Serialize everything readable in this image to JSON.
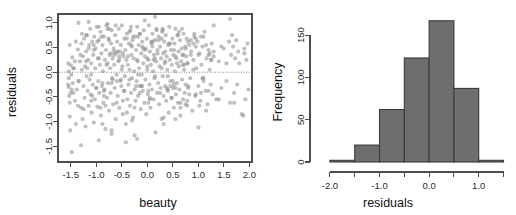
{
  "figure": {
    "width": 516,
    "height": 215,
    "background": "#ffffff",
    "point_color": "#8c8c8c",
    "bar_color": "#6e6e6e",
    "bar_border_color": "#3a3a3a",
    "axis_color": "#4d4d4d"
  },
  "chart_data": [
    {
      "type": "scatter",
      "title": "",
      "xlabel": "beauty",
      "ylabel": "residuals",
      "xlim": [
        -1.75,
        2.05
      ],
      "ylim": [
        -1.82,
        1.18
      ],
      "xticks": [
        -1.5,
        -1.0,
        -0.5,
        0.0,
        0.5,
        1.0,
        1.5,
        2.0
      ],
      "xticklabels": [
        "-1.5",
        "-1.0",
        "-0.5",
        "0.0",
        "0.5",
        "1.0",
        "1.5",
        "2.0"
      ],
      "yticks": [
        -1.5,
        -1.0,
        -0.5,
        0.0,
        0.5,
        1.0
      ],
      "yticklabels": [
        "-1.5",
        "-1.0",
        "-0.5",
        "0.0",
        "0.5",
        "1.0"
      ],
      "grid": false,
      "legend": false,
      "frame": "box",
      "annotations": [
        {
          "kind": "hline",
          "y": 0.0,
          "style": "dotted",
          "color": "#808080"
        }
      ],
      "x": [
        -1.54,
        -1.54,
        -1.54,
        -1.53,
        -1.52,
        -1.52,
        -1.51,
        -1.5,
        -1.49,
        -1.48,
        -1.47,
        -1.46,
        -1.45,
        -1.44,
        -1.42,
        -1.4,
        -1.38,
        -1.36,
        -1.34,
        -1.32,
        -1.3,
        -1.29,
        -1.28,
        -1.27,
        -1.26,
        -1.25,
        -1.24,
        -1.23,
        -1.22,
        -1.21,
        -1.2,
        -1.19,
        -1.18,
        -1.17,
        -1.16,
        -1.15,
        -1.14,
        -1.13,
        -1.12,
        -1.11,
        -1.1,
        -1.09,
        -1.08,
        -1.07,
        -1.06,
        -1.05,
        -1.04,
        -1.03,
        -1.02,
        -1.01,
        -1.0,
        -0.99,
        -0.98,
        -0.97,
        -0.96,
        -0.95,
        -0.94,
        -0.93,
        -0.92,
        -0.91,
        -0.9,
        -0.89,
        -0.88,
        -0.87,
        -0.86,
        -0.85,
        -0.84,
        -0.83,
        -0.82,
        -0.81,
        -0.8,
        -0.79,
        -0.78,
        -0.77,
        -0.76,
        -0.75,
        -0.74,
        -0.73,
        -0.72,
        -0.71,
        -0.7,
        -0.7,
        -0.69,
        -0.68,
        -0.67,
        -0.66,
        -0.65,
        -0.64,
        -0.63,
        -0.62,
        -0.61,
        -0.6,
        -0.59,
        -0.58,
        -0.57,
        -0.56,
        -0.55,
        -0.54,
        -0.53,
        -0.52,
        -0.51,
        -0.5,
        -0.49,
        -0.48,
        -0.47,
        -0.46,
        -0.45,
        -0.44,
        -0.43,
        -0.42,
        -0.41,
        -0.4,
        -0.39,
        -0.38,
        -0.37,
        -0.36,
        -0.35,
        -0.34,
        -0.33,
        -0.32,
        -0.31,
        -0.3,
        -0.29,
        -0.28,
        -0.27,
        -0.26,
        -0.25,
        -0.24,
        -0.23,
        -0.22,
        -0.21,
        -0.2,
        -0.2,
        -0.19,
        -0.18,
        -0.17,
        -0.16,
        -0.15,
        -0.14,
        -0.13,
        -0.12,
        -0.11,
        -0.1,
        -0.09,
        -0.08,
        -0.07,
        -0.06,
        -0.05,
        -0.04,
        -0.03,
        -0.02,
        -0.01,
        0.0,
        0.01,
        0.02,
        0.03,
        0.04,
        0.05,
        0.06,
        0.07,
        0.08,
        0.09,
        0.1,
        0.11,
        0.12,
        0.13,
        0.14,
        0.15,
        0.16,
        0.17,
        0.18,
        0.19,
        0.2,
        0.21,
        0.22,
        0.23,
        0.24,
        0.25,
        0.26,
        0.27,
        0.28,
        0.29,
        0.3,
        0.31,
        0.32,
        0.33,
        0.34,
        0.35,
        0.36,
        0.37,
        0.38,
        0.39,
        0.4,
        0.41,
        0.42,
        0.43,
        0.44,
        0.45,
        0.46,
        0.47,
        0.48,
        0.49,
        0.5,
        0.51,
        0.52,
        0.53,
        0.54,
        0.55,
        0.56,
        0.57,
        0.58,
        0.59,
        0.6,
        0.61,
        0.62,
        0.63,
        0.64,
        0.65,
        0.66,
        0.67,
        0.68,
        0.69,
        0.7,
        0.71,
        0.72,
        0.73,
        0.74,
        0.75,
        0.76,
        0.77,
        0.78,
        0.79,
        0.8,
        0.82,
        0.84,
        0.86,
        0.88,
        0.9,
        0.92,
        0.94,
        0.96,
        0.98,
        1.0,
        1.02,
        1.04,
        1.06,
        1.08,
        1.1,
        1.12,
        1.14,
        1.16,
        1.18,
        1.2,
        1.22,
        1.24,
        1.26,
        1.28,
        1.3,
        1.35,
        1.4,
        1.45,
        1.5,
        1.55,
        1.6,
        1.62,
        1.64,
        1.66,
        1.68,
        1.7,
        1.72,
        1.74,
        1.76,
        1.78,
        1.8,
        1.85,
        1.9,
        1.92,
        1.94,
        1.96,
        1.98,
        -1.55,
        -1.55,
        -1.5,
        -1.45,
        -1.4,
        -1.35,
        -1.31,
        -1.25,
        -1.2,
        -1.15,
        -1.1,
        -1.05,
        -1.0,
        -0.95,
        -0.9,
        -0.85,
        -0.8,
        -0.75,
        -0.7,
        -0.65,
        -0.6,
        -0.55,
        -0.5,
        -0.45,
        -0.4,
        -0.35,
        -0.3,
        -0.25,
        -0.2,
        -0.15,
        -0.1,
        -0.05,
        0.0,
        0.05,
        0.1,
        0.15,
        0.2,
        0.25,
        0.3,
        0.35,
        0.4,
        0.45,
        0.5,
        0.55,
        0.6,
        0.65,
        0.7,
        0.75,
        0.8,
        0.85,
        0.9,
        0.95,
        1.0,
        1.05,
        1.1,
        1.15,
        1.2,
        1.25,
        1.3,
        1.4,
        -1.2,
        -1.1,
        -0.95,
        -0.85,
        -0.75,
        -0.6,
        -0.48,
        -0.35,
        -0.22,
        -0.1,
        0.02,
        0.15,
        0.28,
        0.4,
        0.52,
        0.65,
        0.78,
        0.9,
        1.05,
        1.2,
        -0.88,
        -0.62,
        -0.4,
        -0.18,
        0.05,
        0.3,
        0.55,
        0.8,
        1.02,
        1.25,
        -1.3,
        -0.7,
        -0.3,
        0.1,
        0.45,
        0.85,
        1.15,
        1.55,
        1.7,
        1.9,
        -1.52,
        -1.48,
        -1.42,
        -1.36,
        -1.28,
        -1.18,
        -1.08,
        -0.98,
        -0.88,
        -0.78,
        -0.68,
        -0.58,
        -0.48,
        -0.38,
        -0.28,
        -0.18,
        -0.08,
        0.02,
        0.12,
        0.22,
        0.32,
        0.42,
        0.52,
        0.62,
        0.72,
        0.82,
        0.95,
        1.08,
        1.22,
        1.45,
        -1.05,
        -0.82,
        -0.55,
        -0.32,
        -0.12,
        0.08,
        0.28,
        0.48,
        0.7,
        0.92,
        -0.92,
        -0.72,
        -0.52,
        -0.32,
        -0.15,
        0.0,
        0.18,
        0.38,
        0.58,
        0.78,
        -1.15,
        -0.78,
        -0.42,
        -0.05,
        0.32,
        0.68,
        1.0,
        1.3,
        1.62,
        1.88,
        -0.65,
        -0.25,
        0.15,
        0.55,
        0.95,
        -1.35,
        -0.95,
        0.35,
        0.75,
        1.1
      ],
      "y": [
        0.02,
        -0.12,
        -0.3,
        -0.48,
        -0.62,
        -0.9,
        -1.18,
        0.14,
        -0.05,
        -1.62,
        0.3,
        -0.22,
        -0.42,
        0.08,
        -0.58,
        -1.05,
        -0.35,
        0.46,
        -0.18,
        0.22,
        -0.72,
        0.58,
        0.05,
        -0.95,
        0.32,
        -0.28,
        0.68,
        -0.52,
        0.12,
        -1.1,
        0.42,
        -0.08,
        0.75,
        -0.38,
        0.25,
        -0.68,
        0.55,
        -0.15,
        0.88,
        -0.45,
        0.18,
        -0.82,
        0.62,
        -0.25,
        0.35,
        -1.02,
        0.72,
        -0.55,
        0.08,
        0.48,
        -0.32,
        0.92,
        -0.7,
        0.28,
        -0.18,
        0.65,
        -0.42,
        0.15,
        0.82,
        -0.88,
        0.38,
        -0.28,
        0.55,
        0.02,
        -0.62,
        0.72,
        -0.35,
        0.25,
        -1.15,
        0.45,
        0.95,
        -0.52,
        0.18,
        -0.22,
        0.68,
        -0.78,
        0.35,
        0.08,
        -0.42,
        0.58,
        -1.25,
        0.85,
        -0.12,
        0.28,
        -0.65,
        0.48,
        0.15,
        -0.32,
        0.75,
        -0.95,
        0.38,
        -0.05,
        0.62,
        -0.48,
        0.22,
        0.88,
        -0.72,
        0.42,
        -0.18,
        0.55,
        -0.28,
        0.95,
        0.12,
        -0.85,
        0.32,
        -0.38,
        0.68,
        -0.08,
        0.45,
        -1.05,
        0.25,
        0.78,
        -0.55,
        0.15,
        -0.25,
        0.58,
        0.05,
        -0.68,
        0.85,
        -0.42,
        0.35,
        -0.12,
        0.65,
        -0.92,
        0.28,
        0.02,
        -0.35,
        0.72,
        -0.58,
        0.45,
        -0.18,
        0.92,
        -1.35,
        0.22,
        -0.48,
        0.55,
        0.08,
        -0.28,
        0.78,
        -0.75,
        0.38,
        -0.05,
        0.62,
        -0.38,
        0.18,
        0.85,
        -0.62,
        0.32,
        -0.15,
        0.48,
        -0.85,
        0.68,
        0.05,
        -0.45,
        0.25,
        0.95,
        -0.25,
        0.42,
        -0.72,
        0.15,
        0.58,
        -0.35,
        0.78,
        0.02,
        -0.55,
        0.35,
        -0.12,
        0.65,
        -1.22,
        0.22,
        0.88,
        -0.42,
        0.45,
        -0.22,
        0.72,
        -0.65,
        0.12,
        0.52,
        -0.32,
        0.28,
        -0.95,
        0.82,
        -0.08,
        0.38,
        -0.48,
        0.62,
        0.18,
        -0.28,
        0.75,
        -0.58,
        0.32,
        0.05,
        -0.38,
        0.55,
        -0.82,
        0.92,
        0.25,
        -0.18,
        0.45,
        -0.52,
        0.15,
        0.68,
        -0.32,
        0.35,
        -0.72,
        0.58,
        0.02,
        0.88,
        -0.45,
        0.28,
        -0.22,
        0.75,
        -0.62,
        0.42,
        0.12,
        -0.35,
        0.65,
        -0.88,
        0.22,
        0.48,
        -0.15,
        0.35,
        -0.55,
        0.78,
        0.05,
        -0.42,
        0.52,
        -0.25,
        0.32,
        0.68,
        -0.68,
        0.18,
        -0.32,
        0.55,
        -0.12,
        0.42,
        -0.78,
        0.25,
        0.72,
        -0.48,
        0.08,
        0.62,
        -0.28,
        0.38,
        -0.58,
        0.15,
        0.52,
        -0.18,
        0.82,
        -0.38,
        0.28,
        -0.65,
        0.45,
        0.05,
        -0.25,
        0.58,
        -0.45,
        0.32,
        -0.55,
        0.22,
        -0.32,
        0.48,
        -0.18,
        0.62,
        -0.62,
        0.35,
        0.75,
        0.52,
        -0.42,
        0.28,
        0.65,
        -0.25,
        0.42,
        0.18,
        -0.85,
        0.38,
        -0.55,
        0.25,
        0.58,
        -0.35,
        -0.25,
        0.18,
        -0.42,
        0.08,
        0.62,
        -0.18,
        0.35,
        -0.75,
        0.22,
        0.48,
        -0.05,
        0.55,
        -0.32,
        0.28,
        0.72,
        -0.48,
        0.15,
        0.88,
        -0.22,
        0.42,
        -0.62,
        0.32,
        0.05,
        -0.38,
        0.68,
        -0.15,
        0.52,
        -0.72,
        0.25,
        0.78,
        -0.28,
        0.45,
        0.12,
        -0.55,
        0.62,
        -0.08,
        0.38,
        -0.42,
        0.85,
        0.22,
        -0.35,
        0.58,
        -0.18,
        0.32,
        0.75,
        -0.62,
        0.15,
        0.48,
        -0.28,
        0.65,
        0.05,
        -0.45,
        0.35,
        0.72,
        -0.12,
        0.55,
        -0.38,
        0.25,
        0.42,
        -0.55,
        0.75,
        -0.58,
        0.92,
        -0.38,
        0.65,
        -0.18,
        0.38,
        0.82,
        -0.28,
        0.52,
        -0.62,
        0.28,
        0.68,
        -0.08,
        0.45,
        -0.72,
        0.18,
        0.58,
        -0.42,
        0.35,
        -1.05,
        0.95,
        -0.82,
        0.72,
        -0.52,
        0.88,
        -0.32,
        0.62,
        -0.68,
        0.25,
        -1.48,
        -1.18,
        -0.98,
        0.52,
        -0.28,
        0.35,
        -0.78,
        0.18,
        -0.62,
        0.48,
        0.55,
        -0.35,
        0.22,
        -0.68,
        0.78,
        0.08,
        -0.48,
        0.62,
        -0.22,
        0.88,
        -0.15,
        0.42,
        -0.58,
        0.32,
        0.72,
        -0.05,
        0.48,
        -0.38,
        0.25,
        0.65,
        -0.92,
        0.58,
        -0.25,
        0.82,
        0.15,
        -0.45,
        0.68,
        -0.12,
        0.38,
        0.52,
        0.45,
        -0.68,
        0.25,
        0.92,
        -0.28,
        0.62,
        0.08,
        -0.52,
        0.35,
        0.78,
        -0.72,
        0.38,
        -0.15,
        0.55,
        -0.42,
        0.28,
        0.85,
        -0.32,
        0.18,
        -0.58,
        1.02,
        0.98,
        -1.42,
        1.05,
        -1.05,
        0.88,
        -1.12,
        0.95,
        1.08,
        -0.88,
        0.35,
        -1.28,
        1.12,
        -0.95,
        0.52,
        1.0,
        -1.38,
        0.42,
        -0.65,
        0.72
      ]
    },
    {
      "type": "bar",
      "subtype": "histogram",
      "title": "",
      "xlabel": "residuals",
      "ylabel": "Frequency",
      "xlim": [
        -2.2,
        1.55
      ],
      "ylim": [
        0,
        175
      ],
      "xticks": [
        -2.0,
        -1.5,
        -1.0,
        -0.5,
        0.0,
        0.5,
        1.0,
        1.5
      ],
      "xticklabels": [
        "-2.0",
        "",
        "-1.0",
        "",
        "0.0",
        "",
        "1.0",
        ""
      ],
      "yticks": [
        0,
        50,
        100,
        150
      ],
      "yticklabels": [
        "0",
        "50",
        "100",
        "150"
      ],
      "grid": false,
      "legend": false,
      "frame": "L",
      "bin_width": 0.5,
      "bin_edges": [
        -2.0,
        -1.5,
        -1.0,
        -0.5,
        0.0,
        0.5,
        1.0,
        1.5
      ],
      "categories": [
        "-2.0 to -1.5",
        "-1.5 to -1.0",
        "-1.0 to -0.5",
        "-0.5 to 0.0",
        "0.0 to 0.5",
        "0.5 to 1.0",
        "1.0 to 1.5"
      ],
      "values": [
        2,
        20,
        62,
        123,
        167,
        87,
        2
      ]
    }
  ]
}
